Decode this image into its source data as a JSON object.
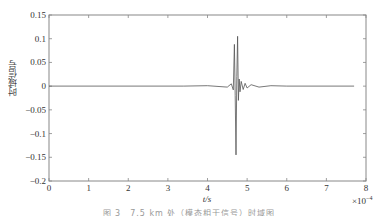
{
  "chart_data": {
    "type": "line",
    "title": "",
    "xlabel": "t/s",
    "ylabel": "时域信号",
    "x_multiplier": "×10^-4",
    "x_multiplier_display": "×10",
    "x_multiplier_exp": "−4",
    "xlim": [
      0,
      8
    ],
    "ylim": [
      -0.2,
      0.15
    ],
    "xticks": [
      0,
      1,
      2,
      3,
      4,
      5,
      6,
      7,
      8
    ],
    "yticks": [
      0.15,
      0.1,
      0.05,
      0,
      -0.05,
      -0.1,
      -0.15,
      -0.2
    ],
    "xtick_labels": [
      "0",
      "1",
      "2",
      "3",
      "4",
      "5",
      "6",
      "7",
      "8"
    ],
    "ytick_labels": [
      "0.15",
      "0.1",
      "0.05",
      "0",
      "−0.05",
      "−0.1",
      "−0.15",
      "−0.2"
    ],
    "grid": false,
    "legend": null,
    "series": [
      {
        "name": "time-domain signal",
        "color": "#555555",
        "x": [
          0,
          3.4,
          4.0,
          4.5,
          4.6,
          4.65,
          4.68,
          4.7,
          4.72,
          4.74,
          4.76,
          4.78,
          4.8,
          4.82,
          4.85,
          4.9,
          4.95,
          5.0,
          5.1,
          5.3,
          5.6,
          6.0,
          7.7
        ],
        "y": [
          0,
          0,
          0.001,
          -0.002,
          0.005,
          -0.008,
          0.088,
          -0.02,
          -0.145,
          0.02,
          0.105,
          -0.03,
          0.015,
          -0.012,
          0.01,
          -0.007,
          0.006,
          -0.004,
          0.003,
          -0.002,
          0.001,
          0,
          0
        ]
      }
    ]
  },
  "caption": "图 3　7.5 km 处（模态相干信号）时域图"
}
